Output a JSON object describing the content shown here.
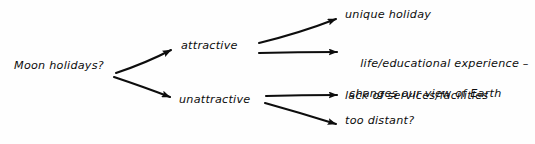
{
  "diagram": {
    "type": "tree",
    "style": "hand-drawn",
    "ink_color": "#0d0d0d",
    "background_color": "#fefefe",
    "root": {
      "label": "Moon holidays?"
    },
    "branches": [
      {
        "id": "attractive",
        "label": "attractive",
        "leaves": [
          {
            "id": "unique-holiday",
            "line1": "unique holiday",
            "line2": ""
          },
          {
            "id": "life-educational-experience",
            "line1": "life/educational experience –",
            "line2": "changes our view of Earth"
          }
        ]
      },
      {
        "id": "unattractive",
        "label": "unattractive",
        "leaves": [
          {
            "id": "lack-of-services",
            "line1": "lack of services/facilities",
            "line2": ""
          },
          {
            "id": "too-distant",
            "line1": "too distant?",
            "line2": ""
          }
        ]
      }
    ],
    "connectors": [
      {
        "id": "root-to-attractive",
        "from": "Moon holidays?",
        "to": "attractive",
        "icon": "arrow-icon"
      },
      {
        "id": "root-to-unattractive",
        "from": "Moon holidays?",
        "to": "unattractive",
        "icon": "arrow-icon"
      },
      {
        "id": "attractive-to-unique",
        "from": "attractive",
        "to": "unique holiday",
        "icon": "arrow-icon"
      },
      {
        "id": "attractive-to-experience",
        "from": "attractive",
        "to": "life/educational experience –",
        "icon": "arrow-icon"
      },
      {
        "id": "unattractive-to-services",
        "from": "unattractive",
        "to": "lack of services/facilities",
        "icon": "arrow-icon"
      },
      {
        "id": "unattractive-to-distant",
        "from": "unattractive",
        "to": "too distant?",
        "icon": "arrow-icon"
      }
    ]
  }
}
